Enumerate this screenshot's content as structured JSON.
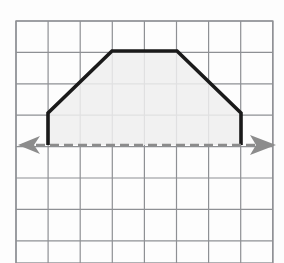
{
  "figure": {
    "canvas": {
      "width": 284,
      "height": 263
    },
    "background_color": "#fdfdfd",
    "grid": {
      "name": "grid-paper",
      "origin_x": 16,
      "origin_y": 21,
      "cell_width": 32.1,
      "cell_height": 31.4,
      "columns": 8,
      "rows": 8,
      "line_color": "#8e9094",
      "line_width": 1.2,
      "border_color": "#8e9094",
      "border_width": 1.4
    },
    "shape": {
      "name": "trapezoid",
      "type": "polygon",
      "stroke_color": "#1a1a1a",
      "stroke_width": 3.6,
      "fill_color": "#efefef",
      "fill_opacity": 0.85,
      "points": "48,145 48,113 112,51 177,51 241,113 241,145",
      "vertices": [
        {
          "label": "bottom-left",
          "x": 48,
          "y": 145
        },
        {
          "label": "upper-left",
          "x": 48,
          "y": 113
        },
        {
          "label": "top-left",
          "x": 112,
          "y": 51
        },
        {
          "label": "top-right",
          "x": 177,
          "y": 51
        },
        {
          "label": "upper-right",
          "x": 241,
          "y": 113
        },
        {
          "label": "bottom-right",
          "x": 241,
          "y": 145
        }
      ]
    },
    "axis": {
      "name": "horizontal-axis",
      "y": 145,
      "x_start": 22,
      "x_end": 268,
      "color": "#8c8c8c",
      "stroke_width": 2.6,
      "dash_pattern": "9 5",
      "left_arrow": {
        "name": "left-arrowhead",
        "points": "18,145 40,136 34,145 40,154",
        "color": "#8c8c8c"
      },
      "right_arrow": {
        "name": "right-arrowhead",
        "points": "276,145 250,135 256,145 250,155",
        "color": "#8c8c8c"
      }
    }
  }
}
